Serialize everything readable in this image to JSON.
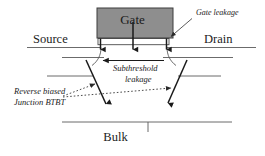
{
  "figure": {
    "type": "diagram",
    "background_color": "#ffffff",
    "line_color": "#4c4c4c",
    "arrow_color": "#1a1a1a",
    "gate_fill_color": "#8e8e8e",
    "gate_border_color": "#3c3c3c"
  },
  "labels": {
    "gate": "Gate",
    "source": "Source",
    "drain": "Drain",
    "bulk": "Bulk",
    "gate_leakage": "Gate leakage",
    "subthreshold": "Subthreshold",
    "leakage": "leakage",
    "reverse_biased": "Reverse biased",
    "junction_btbt": "Junction BTBT"
  },
  "annotations": [
    {
      "name": "gate-leakage",
      "text": "Gate leakage",
      "style": "italic",
      "leader": "solid-arrow",
      "points_to": "gate-oxide-right-edge"
    },
    {
      "name": "subthreshold-leakage",
      "text": "Subthreshold leakage",
      "style": "italic",
      "leader": "horizontal-arrow-left",
      "points_to": "source-channel"
    },
    {
      "name": "reverse-biased-junction-btbt",
      "text": "Reverse biased Junction BTBT",
      "style": "italic",
      "leader": "dotted-arrows",
      "points_to": "both-junctions"
    }
  ],
  "elements": {
    "gate_electrode": "Gate",
    "gate_oxide": "thin oxide strip",
    "source_terminal": "Source",
    "drain_terminal": "Drain",
    "bulk_terminal": "Bulk",
    "gate_leakage_arrows": 3,
    "junction_btbt_arrows": 2,
    "subthreshold_arrows": 1
  }
}
